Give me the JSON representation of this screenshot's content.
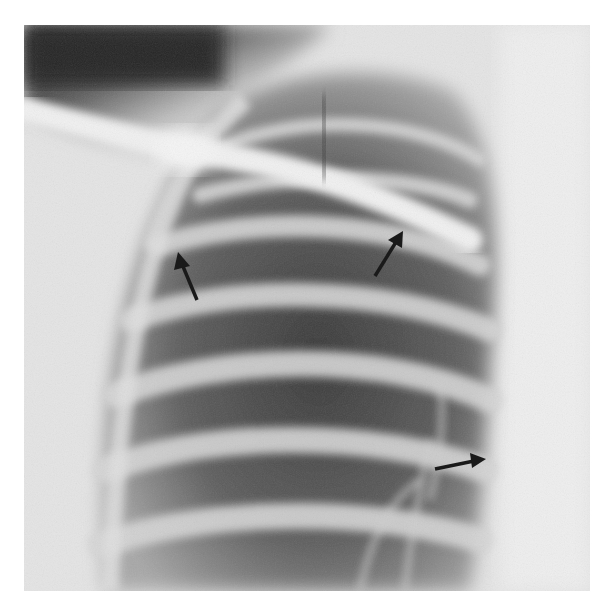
{
  "image": {
    "subject": "chest radiograph, upper lung field with ribs and clavicle",
    "grayscale": true,
    "background_color": "#ffffff"
  },
  "annotations": {
    "arrows": [
      {
        "name": "arrow-upper-left",
        "tail": [
          197,
          300
        ],
        "head": [
          178,
          253
        ],
        "color": "#1a1a1a"
      },
      {
        "name": "arrow-upper-middle",
        "tail": [
          375,
          276
        ],
        "head": [
          402,
          232
        ],
        "color": "#1a1a1a"
      },
      {
        "name": "arrow-lower-right",
        "tail": [
          435,
          469
        ],
        "head": [
          486,
          459
        ],
        "color": "#1a1a1a"
      }
    ]
  }
}
